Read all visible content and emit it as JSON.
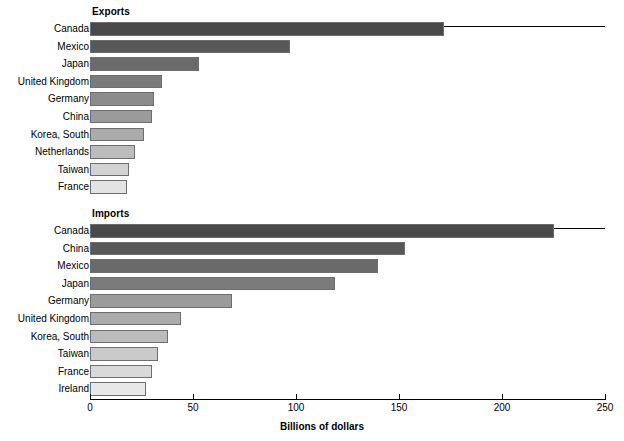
{
  "axis": {
    "title": "Billions of dollars",
    "ticks": [
      {
        "value": 0,
        "label": "0"
      },
      {
        "value": 50,
        "label": "50"
      },
      {
        "value": 100,
        "label": "100"
      },
      {
        "value": 150,
        "label": "150"
      },
      {
        "value": 200,
        "label": "200"
      },
      {
        "value": 250,
        "label": "250"
      }
    ],
    "min": 0,
    "max": 250
  },
  "panels": {
    "exports": {
      "title": "Exports"
    },
    "imports": {
      "title": "Imports"
    }
  },
  "colors": {
    "bar_darkest": "#4a4a4a",
    "bar_lightest": "#e3e3e3",
    "bar_border": "#6e6e6e",
    "axis": "#000000",
    "background": "#ffffff"
  },
  "chart_data": [
    {
      "type": "bar",
      "orientation": "horizontal",
      "title": "Exports",
      "xlabel": "Billions of dollars",
      "ylabel": "",
      "xlim": [
        0,
        250
      ],
      "grid": false,
      "legend": "none",
      "categories": [
        "Canada",
        "Mexico",
        "Japan",
        "United Kingdom",
        "Germany",
        "China",
        "Korea, South",
        "Netherlands",
        "Taiwan",
        "France"
      ],
      "values": [
        172,
        97,
        53,
        35,
        31,
        30,
        26,
        22,
        19,
        18
      ],
      "bar_colors": [
        "#4a4a4a",
        "#585858",
        "#6a6a6a",
        "#7b7b7b",
        "#8c8c8c",
        "#9b9b9b",
        "#ababab",
        "#bcbcbc",
        "#d2d2d2",
        "#e3e3e3"
      ]
    },
    {
      "type": "bar",
      "orientation": "horizontal",
      "title": "Imports",
      "xlabel": "Billions of dollars",
      "ylabel": "",
      "xlim": [
        0,
        250
      ],
      "grid": false,
      "legend": "none",
      "categories": [
        "Canada",
        "China",
        "Mexico",
        "Japan",
        "Germany",
        "United Kingdom",
        "Korea, South",
        "Taiwan",
        "France",
        "Ireland"
      ],
      "values": [
        225,
        153,
        140,
        119,
        69,
        44,
        38,
        33,
        30,
        27
      ],
      "bar_colors": [
        "#4a4a4a",
        "#585858",
        "#6a6a6a",
        "#7b7b7b",
        "#9b9b9b",
        "#ababab",
        "#bcbcbc",
        "#cacaca",
        "#d9d9d9",
        "#e8e8e8"
      ]
    }
  ]
}
